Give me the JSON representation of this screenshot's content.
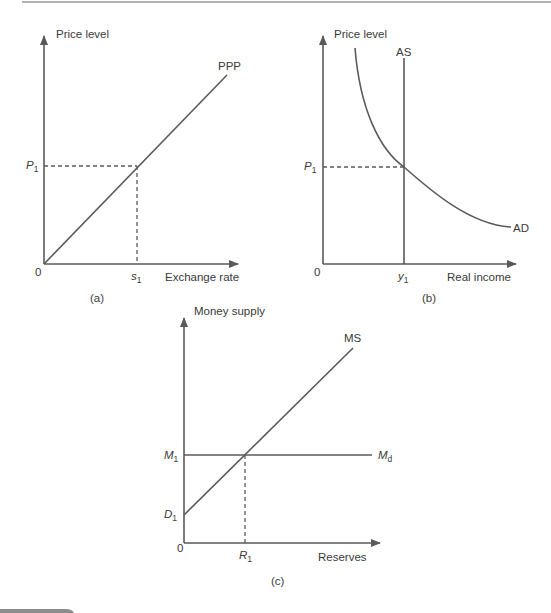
{
  "figure": {
    "panels": [
      {
        "id": "a",
        "caption": "(a)",
        "y_axis_label": "Price level",
        "x_axis_label": "Exchange rate",
        "origin_label": "0",
        "curves": [
          {
            "name": "PPP",
            "type": "line",
            "description": "upward-sloping line from origin"
          }
        ],
        "y_marker": {
          "base": "P",
          "sub": "1"
        },
        "x_marker": {
          "base": "s",
          "sub": "1"
        }
      },
      {
        "id": "b",
        "caption": "(b)",
        "y_axis_label": "Price level",
        "x_axis_label": "Real income",
        "origin_label": "0",
        "curves": [
          {
            "name": "AS",
            "type": "vertical line"
          },
          {
            "name": "AD",
            "type": "downward-sloping convex curve"
          }
        ],
        "y_marker": {
          "base": "P",
          "sub": "1"
        },
        "x_marker": {
          "base": "y",
          "sub": "1"
        }
      },
      {
        "id": "c",
        "caption": "(c)",
        "y_axis_label": "Money supply",
        "x_axis_label": "Reserves",
        "origin_label": "0",
        "curves": [
          {
            "name": "MS",
            "type": "upward-sloping line with intercept D1"
          },
          {
            "name_base": "M",
            "name_sub": "d",
            "type": "horizontal line at M1"
          }
        ],
        "y_marker": {
          "base": "M",
          "sub": "1"
        },
        "y_intercept": {
          "base": "D",
          "sub": "1"
        },
        "x_marker": {
          "base": "R",
          "sub": "1"
        }
      }
    ]
  },
  "labels": {
    "a_ylabel": "Price level",
    "a_xlabel": "Exchange rate",
    "a_zero": "0",
    "a_curve": "PPP",
    "a_p": "P",
    "a_p_sub": "1",
    "a_s": "s",
    "a_s_sub": "1",
    "a_caption": "(a)",
    "b_ylabel": "Price level",
    "b_xlabel": "Real income",
    "b_zero": "0",
    "b_as": "AS",
    "b_ad": "AD",
    "b_p": "P",
    "b_p_sub": "1",
    "b_y": "y",
    "b_y_sub": "1",
    "b_caption": "(b)",
    "c_ylabel": "Money supply",
    "c_xlabel": "Reserves",
    "c_zero": "0",
    "c_ms": "MS",
    "c_md": "M",
    "c_md_sub": "d",
    "c_m": "M",
    "c_m_sub": "1",
    "c_d": "D",
    "c_d_sub": "1",
    "c_r": "R",
    "c_r_sub": "1",
    "c_caption": "(c)"
  },
  "colors": {
    "line": "#5a5a5a",
    "text": "#3a3a3a",
    "top_rule": "#9a9a9a",
    "bottom_band": "#8c8c8c"
  }
}
